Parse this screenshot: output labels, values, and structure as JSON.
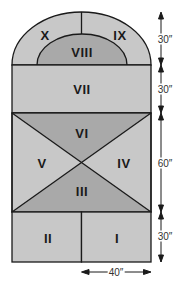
{
  "colors": {
    "light_fill": "#c8c8c8",
    "dark_fill": "#a9a9a9",
    "stroke": "#1a1a1a",
    "background": "#ffffff"
  },
  "regions": [
    {
      "id": "I",
      "label": "I"
    },
    {
      "id": "II",
      "label": "II"
    },
    {
      "id": "III",
      "label": "III"
    },
    {
      "id": "IV",
      "label": "IV"
    },
    {
      "id": "V",
      "label": "V"
    },
    {
      "id": "VI",
      "label": "VI"
    },
    {
      "id": "VII",
      "label": "VII"
    },
    {
      "id": "VIII",
      "label": "VIII"
    },
    {
      "id": "IX",
      "label": "IX"
    },
    {
      "id": "X",
      "label": "X"
    }
  ],
  "dimensions": {
    "arch_height": "30″",
    "band_height": "30″",
    "cross_height": "60″",
    "base_height": "30″",
    "half_width": "40″"
  }
}
